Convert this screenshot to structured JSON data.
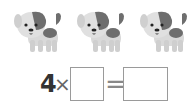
{
  "items": {
    "count": 3,
    "icon": "puppy-icon"
  },
  "equation": {
    "multiplicand": "4",
    "times_symbol": "×",
    "equals_symbol": "=",
    "blank1": "",
    "blank2": ""
  },
  "colors": {
    "dog_body": "#d9d9d9",
    "dog_patch": "#6e6e6e",
    "box_border": "#9a9a9a"
  }
}
